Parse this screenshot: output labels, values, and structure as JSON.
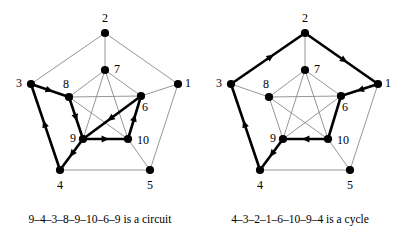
{
  "figure": {
    "colors": {
      "background": "#ffffff",
      "thin_edge": "#8a8a8a",
      "bold_edge": "#000000",
      "node_fill": "#000000",
      "label": "#000000"
    }
  },
  "panels": [
    {
      "id": "left",
      "caption": "9–4–3–8–9–10–6–9 is a circuit",
      "walk": [
        9,
        4,
        3,
        8,
        9,
        10,
        6,
        9
      ],
      "walk_type": "circuit",
      "nodes": [
        {
          "id": 1,
          "label": "1",
          "x": 178,
          "y": 84,
          "lx": 188,
          "ly": 84
        },
        {
          "id": 2,
          "label": "2",
          "x": 105,
          "y": 33,
          "lx": 105,
          "ly": 19
        },
        {
          "id": 3,
          "label": "3",
          "x": 31,
          "y": 84,
          "lx": 19,
          "ly": 84
        },
        {
          "id": 4,
          "label": "4",
          "x": 60,
          "y": 170,
          "lx": 60,
          "ly": 186
        },
        {
          "id": 5,
          "label": "5",
          "x": 150,
          "y": 170,
          "lx": 150,
          "ly": 186
        },
        {
          "id": 6,
          "label": "6",
          "x": 141,
          "y": 96,
          "lx": 145,
          "ly": 108
        },
        {
          "id": 7,
          "label": "7",
          "x": 105,
          "y": 70,
          "lx": 117,
          "ly": 70
        },
        {
          "id": 8,
          "label": "8",
          "x": 69,
          "y": 97,
          "lx": 66,
          "ly": 85
        },
        {
          "id": 9,
          "label": "9",
          "x": 83,
          "y": 139,
          "lx": 73,
          "ly": 139
        },
        {
          "id": 10,
          "label": "10",
          "x": 128,
          "y": 139,
          "lx": 143,
          "ly": 141
        }
      ],
      "thin_edges": [
        [
          2,
          3
        ],
        [
          2,
          1
        ],
        [
          3,
          4
        ],
        [
          4,
          5
        ],
        [
          5,
          1
        ],
        [
          2,
          7
        ],
        [
          3,
          8
        ],
        [
          1,
          6
        ],
        [
          4,
          9
        ],
        [
          5,
          10
        ],
        [
          7,
          8
        ],
        [
          8,
          9
        ],
        [
          9,
          10
        ],
        [
          10,
          6
        ],
        [
          6,
          7
        ],
        [
          7,
          9
        ],
        [
          7,
          10
        ],
        [
          8,
          10
        ],
        [
          8,
          6
        ],
        [
          9,
          6
        ]
      ],
      "bold_edges": [
        {
          "from": 9,
          "to": 4,
          "arrow": true
        },
        {
          "from": 4,
          "to": 3,
          "arrow": true
        },
        {
          "from": 3,
          "to": 8,
          "arrow": true
        },
        {
          "from": 8,
          "to": 9,
          "arrow": true
        },
        {
          "from": 9,
          "to": 10,
          "arrow": true
        },
        {
          "from": 10,
          "to": 6,
          "arrow": true
        },
        {
          "from": 6,
          "to": 9,
          "arrow": true
        }
      ]
    },
    {
      "id": "right",
      "caption": "4–3–2–1–6–10–9–4 is a cycle",
      "walk": [
        4,
        3,
        2,
        1,
        6,
        10,
        9,
        4
      ],
      "walk_type": "cycle",
      "nodes": [
        {
          "id": 1,
          "label": "1",
          "x": 178,
          "y": 84,
          "lx": 188,
          "ly": 84
        },
        {
          "id": 2,
          "label": "2",
          "x": 105,
          "y": 33,
          "lx": 105,
          "ly": 19
        },
        {
          "id": 3,
          "label": "3",
          "x": 31,
          "y": 84,
          "lx": 19,
          "ly": 84
        },
        {
          "id": 4,
          "label": "4",
          "x": 60,
          "y": 170,
          "lx": 60,
          "ly": 186
        },
        {
          "id": 5,
          "label": "5",
          "x": 150,
          "y": 170,
          "lx": 150,
          "ly": 186
        },
        {
          "id": 6,
          "label": "6",
          "x": 141,
          "y": 96,
          "lx": 145,
          "ly": 108
        },
        {
          "id": 7,
          "label": "7",
          "x": 105,
          "y": 70,
          "lx": 117,
          "ly": 70
        },
        {
          "id": 8,
          "label": "8",
          "x": 69,
          "y": 97,
          "lx": 66,
          "ly": 85
        },
        {
          "id": 9,
          "label": "9",
          "x": 83,
          "y": 139,
          "lx": 73,
          "ly": 139
        },
        {
          "id": 10,
          "label": "10",
          "x": 128,
          "y": 139,
          "lx": 143,
          "ly": 141
        }
      ],
      "thin_edges": [
        [
          3,
          4
        ],
        [
          4,
          5
        ],
        [
          5,
          1
        ],
        [
          2,
          7
        ],
        [
          3,
          8
        ],
        [
          1,
          6
        ],
        [
          4,
          9
        ],
        [
          5,
          10
        ],
        [
          7,
          8
        ],
        [
          8,
          9
        ],
        [
          9,
          10
        ],
        [
          10,
          6
        ],
        [
          6,
          7
        ],
        [
          7,
          9
        ],
        [
          7,
          10
        ],
        [
          8,
          10
        ],
        [
          8,
          6
        ],
        [
          9,
          6
        ]
      ],
      "bold_edges": [
        {
          "from": 4,
          "to": 3,
          "arrow": true
        },
        {
          "from": 3,
          "to": 2,
          "arrow": true
        },
        {
          "from": 2,
          "to": 1,
          "arrow": true
        },
        {
          "from": 1,
          "to": 6,
          "arrow": true
        },
        {
          "from": 6,
          "to": 10,
          "arrow": false
        },
        {
          "from": 10,
          "to": 9,
          "arrow": true
        },
        {
          "from": 9,
          "to": 4,
          "arrow": true
        }
      ]
    }
  ]
}
